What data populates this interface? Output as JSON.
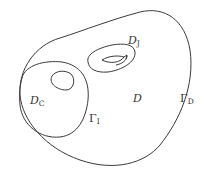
{
  "figure": {
    "type": "domain diagram",
    "labels": {
      "domain_D": {
        "main": "D",
        "sub": ""
      },
      "domain_DJ": {
        "main": "D",
        "sub": "J"
      },
      "domain_DC": {
        "main": "D",
        "sub": "C"
      },
      "boundary_GammaI": {
        "main": "Γ",
        "sub": "I"
      },
      "boundary_GammaD": {
        "main": "Γ",
        "sub": "D"
      }
    },
    "colors": {
      "stroke": "#3a3a3a",
      "text": "#333333",
      "background": "#ffffff"
    }
  }
}
